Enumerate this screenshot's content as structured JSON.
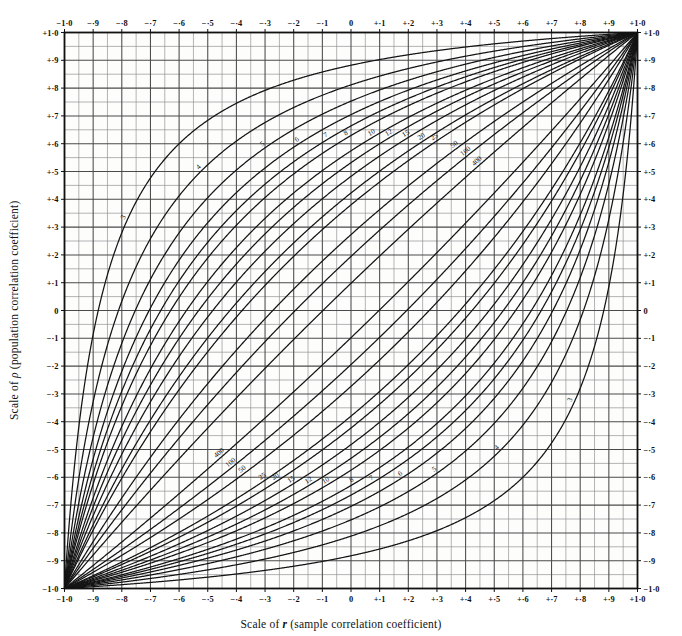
{
  "chart_data": {
    "type": "line",
    "title": "",
    "xlabel": "Scale of r (sample correlation coefficient)",
    "ylabel": "Scale of ρ (population correlation coefficient)",
    "xlim": [
      -1.0,
      1.0
    ],
    "ylim": [
      -1.0,
      1.0
    ],
    "grid": true,
    "grid_major_step": 0.1,
    "grid_minor_step": 0.05,
    "legend_position": "inline-curve-labels",
    "annotation": "Confidence belts for the correlation coefficient; each labelled curve pair gives 95% limits for the stated sample size n.",
    "confidence_level": 0.95,
    "xticks": [
      -1.0,
      -0.9,
      -0.8,
      -0.7,
      -0.6,
      -0.5,
      -0.4,
      -0.3,
      -0.2,
      -0.1,
      0,
      0.1,
      0.2,
      0.3,
      0.4,
      0.5,
      0.6,
      0.7,
      0.8,
      0.9,
      1.0
    ],
    "yticks": [
      1.0,
      0.9,
      0.8,
      0.7,
      0.6,
      0.5,
      0.4,
      0.3,
      0.2,
      0.1,
      0,
      -0.1,
      -0.2,
      -0.3,
      -0.4,
      -0.5,
      -0.6,
      -0.7,
      -0.8,
      -0.9,
      -1.0
    ],
    "xticklabels": [
      "−1·0",
      "−·9",
      "−·8",
      "−·7",
      "−·6",
      "−·5",
      "−·4",
      "−·3",
      "−·2",
      "−·1",
      "0",
      "+·1",
      "+·2",
      "+·3",
      "+·4",
      "+·5",
      "+·6",
      "+·7",
      "+·8",
      "+·9",
      "+1·0"
    ],
    "yticklabels": [
      "+1·0",
      "+·9",
      "+·8",
      "+·7",
      "+·6",
      "+·5",
      "+·4",
      "+·3",
      "+·2",
      "+·1",
      "0",
      "−·1",
      "−·2",
      "−·3",
      "−·4",
      "−·5",
      "−·6",
      "−·7",
      "−·8",
      "−·9",
      "−1·0"
    ],
    "curve_labels": [
      "3",
      "4",
      "5",
      "6",
      "7",
      "8",
      "10",
      "12",
      "15",
      "20",
      "25",
      "50",
      "100",
      "400"
    ],
    "sample_sizes": [
      3,
      4,
      5,
      6,
      7,
      8,
      10,
      12,
      15,
      20,
      25,
      50,
      100,
      400
    ],
    "series": [
      {
        "name": "n=3",
        "n": 3,
        "z_half_width": 1.3859
      },
      {
        "name": "n=4",
        "n": 4,
        "z_half_width": 1.1316
      },
      {
        "name": "n=5",
        "n": 5,
        "z_half_width": 0.98
      },
      {
        "name": "n=6",
        "n": 6,
        "z_half_width": 0.8763
      },
      {
        "name": "n=7",
        "n": 7,
        "z_half_width": 0.7999
      },
      {
        "name": "n=8",
        "n": 8,
        "z_half_width": 0.7406
      },
      {
        "name": "n=10",
        "n": 10,
        "z_half_width": 0.654
      },
      {
        "name": "n=12",
        "n": 12,
        "z_half_width": 0.5925
      },
      {
        "name": "n=15",
        "n": 15,
        "z_half_width": 0.5262
      },
      {
        "name": "n=20",
        "n": 20,
        "z_half_width": 0.4508
      },
      {
        "name": "n=25",
        "n": 25,
        "z_half_width": 0.4001
      },
      {
        "name": "n=50",
        "n": 50,
        "z_half_width": 0.28
      },
      {
        "name": "n=100",
        "n": 100,
        "z_half_width": 0.197
      },
      {
        "name": "n=400",
        "n": 400,
        "z_half_width": 0.0982
      }
    ]
  },
  "axes": {
    "x_title": "Scale of r (sample correlation coefficient)",
    "x_title_prefix": "Scale of ",
    "x_title_symbol": "r",
    "x_title_suffix": " (sample correlation coefficient)",
    "y_title": "Scale of ρ (population correlation coefficient)",
    "y_title_prefix": "Scale of ",
    "y_title_symbol": "ρ",
    "y_title_suffix": " (population correlation coefficient)"
  },
  "colors": {
    "background": "#ffffff",
    "plot_background": "#fdfdfc",
    "grid_minor": "#8d8d8d",
    "grid_major": "#4a4a4a",
    "frame": "#111111",
    "curve": "#141414",
    "text": "#111111"
  }
}
